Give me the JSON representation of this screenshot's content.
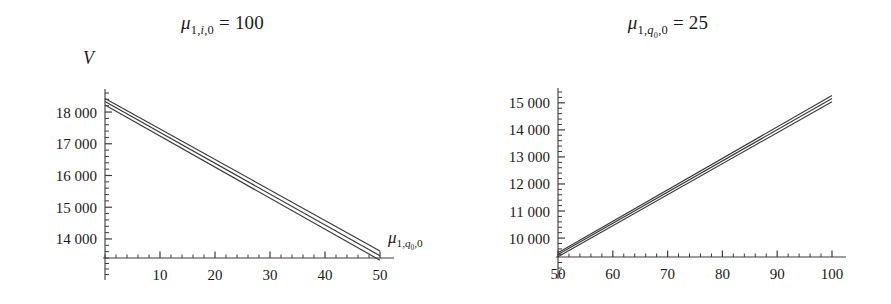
{
  "figure": {
    "background": "#ffffff",
    "text_color": "#1a1a1a",
    "line_color": "#3a3a3a"
  },
  "panels": [
    {
      "id": "left",
      "title_mu": "μ",
      "title_sub": "1,i,0",
      "title_eq": " = 100",
      "ylabel": "V",
      "xlabel_mu": "μ",
      "xlabel_sub": "1,q0,0"
    },
    {
      "id": "right",
      "title_mu": "μ",
      "title_sub": "1,q0,0",
      "title_eq": " = 25",
      "ylabel": "V",
      "xlabel_mu": "μ",
      "xlabel_sub": "1,i,0"
    }
  ],
  "chart_data": [
    {
      "type": "line",
      "id": "left-plot",
      "title": "μ_{1,i,0} = 100",
      "xlabel": "μ_{1,q₀,0}",
      "ylabel": "V",
      "xlim": [
        0,
        50
      ],
      "ylim": [
        13400,
        18600
      ],
      "xticks": [
        10,
        20,
        30,
        40,
        50
      ],
      "xticklabels": [
        "10",
        "20",
        "30",
        "40",
        "50"
      ],
      "yticks": [
        14000,
        15000,
        16000,
        17000,
        18000
      ],
      "yticklabels": [
        "14 000",
        "15 000",
        "16 000",
        "17 000",
        "18 000"
      ],
      "minor_tick_step_x": 2,
      "minor_tick_step_y": 200,
      "grid": false,
      "legend": null,
      "x": [
        0,
        50
      ],
      "series": [
        {
          "name": "upper",
          "values": [
            18430,
            13620
          ]
        },
        {
          "name": "middle",
          "values": [
            18330,
            13470
          ]
        },
        {
          "name": "lower",
          "values": [
            18220,
            13330
          ]
        }
      ]
    },
    {
      "type": "line",
      "id": "right-plot",
      "title": "μ_{1,q₀,0} = 25",
      "xlabel": "μ_{1,i,0}",
      "ylabel": "V",
      "xlim": [
        50,
        100
      ],
      "ylim": [
        9300,
        15400
      ],
      "xticks": [
        50,
        60,
        70,
        80,
        90,
        100
      ],
      "xticklabels": [
        "50",
        "60",
        "70",
        "80",
        "90",
        "100"
      ],
      "yticks": [
        10000,
        11000,
        12000,
        13000,
        14000,
        15000
      ],
      "yticklabels": [
        "10 000",
        "11 000",
        "12 000",
        "13 000",
        "14 000",
        "15 000"
      ],
      "minor_tick_step_x": 2,
      "minor_tick_step_y": 200,
      "grid": false,
      "legend": null,
      "x": [
        50,
        100
      ],
      "series": [
        {
          "name": "upper",
          "values": [
            9460,
            15270
          ]
        },
        {
          "name": "middle",
          "values": [
            9390,
            15160
          ]
        },
        {
          "name": "lower",
          "values": [
            9310,
            15040
          ]
        }
      ]
    }
  ]
}
